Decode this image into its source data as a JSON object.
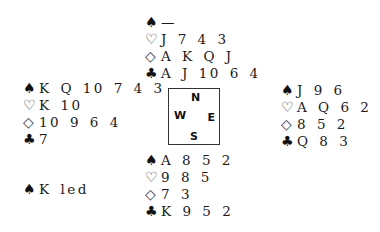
{
  "north": {
    "spades": "—",
    "hearts": "J 7 4 3",
    "diamonds": "A K Q J",
    "clubs": "A J 10 6 4"
  },
  "west": {
    "spades": "K Q 10 7 4 3",
    "hearts": "K 10",
    "diamonds": "10 9 6 4",
    "clubs": "7"
  },
  "east": {
    "spades": "J 9 6",
    "hearts": "A Q 6 2",
    "diamonds": "8 5 2",
    "clubs": "Q 8 3"
  },
  "south": {
    "spades": "A 8 5 2",
    "hearts": "9 8 5",
    "diamonds": "7 3",
    "clubs": "K 9 5 2"
  },
  "compass": {
    "n": "N",
    "w": "W",
    "e": "E",
    "s": "S"
  },
  "suits": {
    "spade": "♠",
    "heart": "♡",
    "diamond": "◇",
    "club": "♣"
  },
  "lead": {
    "suit": "♠",
    "text": "K led"
  }
}
